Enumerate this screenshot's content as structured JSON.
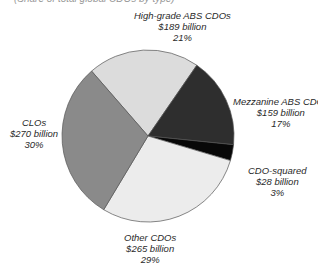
{
  "chart_data": {
    "type": "pie",
    "title": "",
    "subtitle": "(Share of total global CDOs by type)",
    "categories": [
      "High-grade ABS CDOs",
      "Mezzanine ABS CDOs",
      "CDO-squared",
      "Other CDOs",
      "CLOs"
    ],
    "values": [
      189,
      159,
      28,
      265,
      270
    ],
    "unit": "billion USD",
    "percentages": [
      21,
      17,
      3,
      29,
      30
    ],
    "colors": [
      "#dcdcdc",
      "#2e2e2e",
      "#080808",
      "#ececec",
      "#8a8a8a"
    ],
    "slices": [
      {
        "name": "High-grade ABS CDOs",
        "amount": "$189 billion",
        "percent": "21%",
        "value": 189,
        "pct": 21,
        "color": "#dcdcdc"
      },
      {
        "name": "Mezzanine ABS CDOs",
        "amount": "$159 billion",
        "percent": "17%",
        "value": 159,
        "pct": 17,
        "color": "#2e2e2e"
      },
      {
        "name": "CDO-squared",
        "amount": "$28 billion",
        "percent": "3%",
        "value": 28,
        "pct": 3,
        "color": "#080808"
      },
      {
        "name": "Other CDOs",
        "amount": "$265 billion",
        "percent": "29%",
        "value": 265,
        "pct": 29,
        "color": "#ececec"
      },
      {
        "name": "CLOs",
        "amount": "$270 billion",
        "percent": "30%",
        "value": 270,
        "pct": 30,
        "color": "#8a8a8a"
      }
    ],
    "legend_position": "direct labels around pie"
  }
}
